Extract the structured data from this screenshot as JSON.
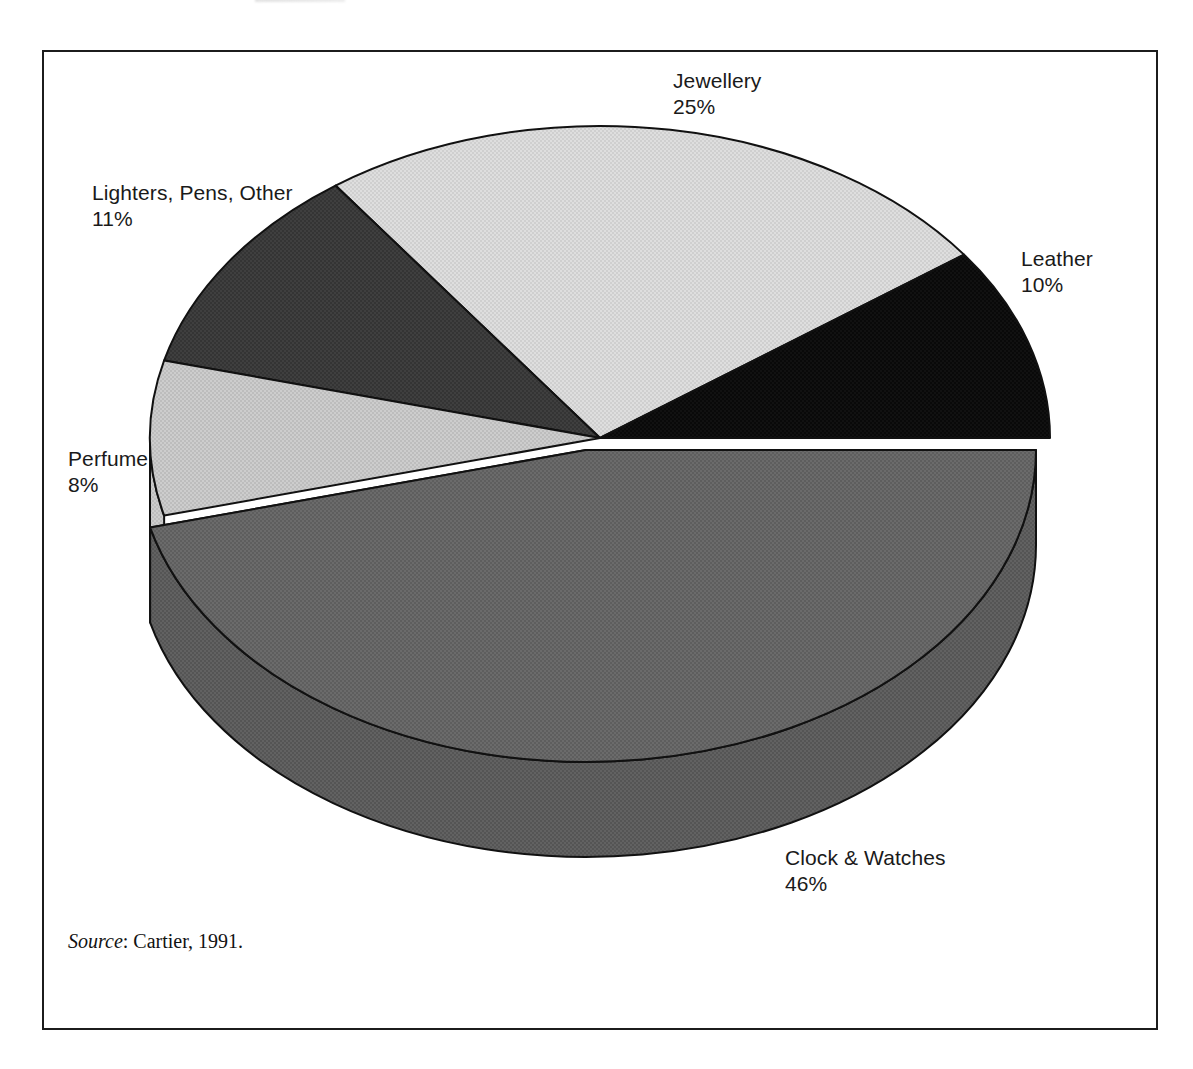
{
  "figure": {
    "source_prefix": "Source",
    "source_text": ": Cartier, 1991."
  },
  "chart_data": {
    "type": "pie",
    "title": "",
    "subtitle": "",
    "xlabel": "",
    "ylabel": "",
    "legend_position": "none",
    "grid": false,
    "style": "3d-exploded-halftone",
    "units": "percent",
    "total": 100,
    "categories": [
      "Clock & Watches",
      "Perfume",
      "Lighters, Pens, Other",
      "Jewellery",
      "Leather"
    ],
    "values": [
      46,
      8,
      11,
      25,
      10
    ],
    "labels": [
      "46%",
      "8%",
      "11%",
      "25%",
      "10%"
    ],
    "slices": [
      {
        "name": "Clock & Watches",
        "label": "Clock & Watches",
        "percent": 46,
        "percent_label": "46%",
        "color": "#666666",
        "side_color": "#5a5a5a",
        "exploded": true,
        "start_angle_deg": 0,
        "end_angle_deg": 165.6
      },
      {
        "name": "Perfume",
        "label": "Perfume",
        "percent": 8,
        "percent_label": "8%",
        "color": "#c8c8c8",
        "side_color": "#b4b4b4",
        "exploded": false,
        "start_angle_deg": 165.6,
        "end_angle_deg": 194.4
      },
      {
        "name": "Lighters, Pens, Other",
        "label": "Lighters, Pens, Other",
        "percent": 11,
        "percent_label": "11%",
        "color": "#3b3b3b",
        "side_color": "#303030",
        "exploded": false,
        "start_angle_deg": 194.4,
        "end_angle_deg": 234.0
      },
      {
        "name": "Jewellery",
        "label": "Jewellery",
        "percent": 25,
        "percent_label": "25%",
        "color": "#dadada",
        "side_color": "#c6c6c6",
        "exploded": false,
        "start_angle_deg": 234.0,
        "end_angle_deg": 324.0
      },
      {
        "name": "Leather",
        "label": "Leather",
        "percent": 10,
        "percent_label": "10%",
        "color": "#0d0d0d",
        "side_color": "#0a0a0a",
        "exploded": false,
        "start_angle_deg": 324.0,
        "end_angle_deg": 360.0
      }
    ],
    "colors": {
      "jewellery": "#dadada",
      "leather": "#0d0d0d",
      "clock_watches": "#666666",
      "perfume": "#c8c8c8",
      "lighters": "#3b3b3b",
      "outline": "#111111",
      "frame": "#1c1c1c",
      "background": "#ffffff"
    },
    "geometry": {
      "center_x": 600,
      "center_y": 438,
      "radius_x": 450,
      "radius_y": 312,
      "depth": 95,
      "explode_offset_x": -14,
      "explode_offset_y": 12
    }
  }
}
